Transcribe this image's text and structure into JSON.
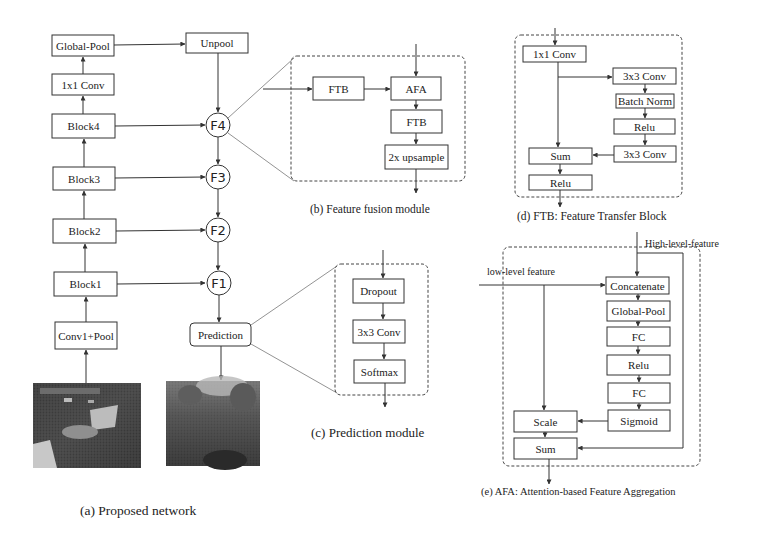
{
  "main_network": {
    "boxes": {
      "global_pool": "Global-Pool",
      "unpool": "Unpool",
      "conv1x1": "1x1 Conv",
      "block4": "Block4",
      "block3": "Block3",
      "block2": "Block2",
      "block1": "Block1",
      "conv1_pool": "Conv1+Pool",
      "prediction": "Prediction"
    },
    "fusion_nodes": [
      "F4",
      "F3",
      "F2",
      "F1"
    ],
    "images": {
      "input": "input-rgb-image",
      "output": "predicted-depth-map"
    },
    "caption": "(a)  Proposed network"
  },
  "fusion_module": {
    "boxes": {
      "ftb_in": "FTB",
      "afa": "AFA",
      "ftb_out": "FTB",
      "upsample": "2x upsample"
    },
    "caption": "(b)  Feature fusion module"
  },
  "prediction_module": {
    "boxes": {
      "dropout": "Dropout",
      "conv3x3": "3x3 Conv",
      "softmax": "Softmax"
    },
    "caption": "(c)  Prediction module"
  },
  "ftb": {
    "boxes": {
      "conv1x1": "1x1 Conv",
      "conv3x3_a": "3x3 Conv",
      "batch_norm": "Batch Norm",
      "relu_a": "Relu",
      "conv3x3_b": "3x3 Conv",
      "sum": "Sum",
      "relu_b": "Relu"
    },
    "caption": "(d)  FTB: Feature Transfer Block"
  },
  "afa": {
    "labels": {
      "high": "High-level-feature",
      "low": "low-level feature"
    },
    "boxes": {
      "concatenate": "Concatenate",
      "global_pool": "Global-Pool",
      "fc_a": "FC",
      "relu": "Relu",
      "fc_b": "FC",
      "sigmoid": "Sigmoid",
      "scale": "Scale",
      "sum": "Sum"
    },
    "caption": "(e)  AFA: Attention-based Feature Aggregation"
  }
}
